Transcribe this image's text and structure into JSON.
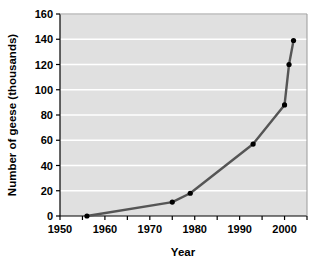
{
  "chart_data": {
    "type": "line",
    "title": "",
    "xlabel": "Year",
    "ylabel": "Number of geese (thousands)",
    "xlim": [
      1950,
      2005
    ],
    "ylim": [
      0,
      160
    ],
    "grid": "horizontal-white-gridlines",
    "legend": "none",
    "background_color": "#e0e0e0",
    "gridline_color": "#ffffff",
    "line_color": "#555555",
    "marker_color": "#000000",
    "x_tick_labels": [
      "1950",
      "1960",
      "1970",
      "1980",
      "1990",
      "2000"
    ],
    "x_tick_values": [
      1950,
      1960,
      1970,
      1980,
      1990,
      2000
    ],
    "x_minor_tick_values": [
      1955,
      1965,
      1975,
      1985,
      1995,
      2005
    ],
    "y_tick_labels": [
      "0",
      "20",
      "40",
      "60",
      "80",
      "100",
      "120",
      "140",
      "160"
    ],
    "y_tick_values": [
      0,
      20,
      40,
      60,
      80,
      100,
      120,
      140,
      160
    ],
    "x": [
      1956,
      1975,
      1979,
      1993,
      2000,
      2001,
      2002
    ],
    "values": [
      0,
      11,
      18,
      57,
      88,
      120,
      139
    ],
    "series": [
      {
        "name": "Number of geese",
        "x": [
          1956,
          1975,
          1979,
          1993,
          2000,
          2001,
          2002
        ],
        "values": [
          0,
          11,
          18,
          57,
          88,
          120,
          139
        ]
      }
    ]
  },
  "axes": {
    "x_title": "Year",
    "y_title": "Number of geese (thousands)"
  }
}
